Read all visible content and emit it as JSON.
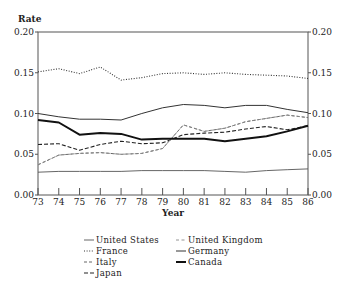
{
  "chart_data": {
    "type": "line",
    "title": "",
    "xlabel": "Year",
    "ylabel": "Rate",
    "x": [
      73,
      74,
      75,
      76,
      77,
      78,
      79,
      80,
      81,
      82,
      83,
      84,
      85,
      86
    ],
    "xticks": [
      "73",
      "74",
      "75",
      "76",
      "77",
      "78",
      "79",
      "80",
      "81",
      "82",
      "83",
      "84",
      "85",
      "86"
    ],
    "ylim": [
      0.0,
      0.2
    ],
    "yticks": [
      "0.00",
      "0.05",
      "0.10",
      "0.15",
      "0.20"
    ],
    "grid": false,
    "legend_position": "below",
    "series": [
      {
        "name": "United States",
        "style": "thin-solid",
        "values": [
          0.028,
          0.029,
          0.029,
          0.029,
          0.029,
          0.03,
          0.03,
          0.03,
          0.03,
          0.029,
          0.028,
          0.03,
          0.031,
          0.032
        ]
      },
      {
        "name": "France",
        "style": "dotted",
        "values": [
          0.151,
          0.155,
          0.149,
          0.157,
          0.141,
          0.144,
          0.149,
          0.15,
          0.148,
          0.15,
          0.148,
          0.147,
          0.146,
          0.143
        ]
      },
      {
        "name": "Italy",
        "style": "short-dashed",
        "values": [
          0.037,
          0.049,
          0.051,
          0.052,
          0.05,
          0.051,
          0.057,
          0.086,
          0.078,
          0.082,
          0.09,
          0.094,
          0.098,
          0.095
        ]
      },
      {
        "name": "Japan",
        "style": "dashed",
        "values": [
          0.062,
          0.063,
          0.055,
          0.062,
          0.066,
          0.063,
          0.064,
          0.074,
          0.076,
          0.077,
          0.081,
          0.084,
          0.08,
          0.085
        ]
      },
      {
        "name": "United Kingdom",
        "style": "light-dashed",
        "values": [
          0.037,
          0.049,
          0.051,
          0.052,
          0.05,
          0.051,
          0.057,
          0.086,
          0.078,
          0.082,
          0.09,
          0.094,
          0.098,
          0.095
        ]
      },
      {
        "name": "Germany",
        "style": "solid",
        "values": [
          0.1,
          0.096,
          0.093,
          0.093,
          0.092,
          0.1,
          0.107,
          0.111,
          0.11,
          0.107,
          0.11,
          0.11,
          0.105,
          0.101
        ]
      },
      {
        "name": "Canada",
        "style": "thick-solid",
        "values": [
          0.092,
          0.089,
          0.074,
          0.076,
          0.075,
          0.068,
          0.069,
          0.069,
          0.069,
          0.066,
          0.069,
          0.072,
          0.078,
          0.085
        ]
      }
    ]
  },
  "axes": {
    "ylabel": "Rate",
    "xlabel": "Year"
  },
  "legend": {
    "col1": [
      "United States",
      "France",
      "Italy",
      "Japan"
    ],
    "col2": [
      "United Kingdom",
      "Germany",
      "Canada"
    ]
  }
}
